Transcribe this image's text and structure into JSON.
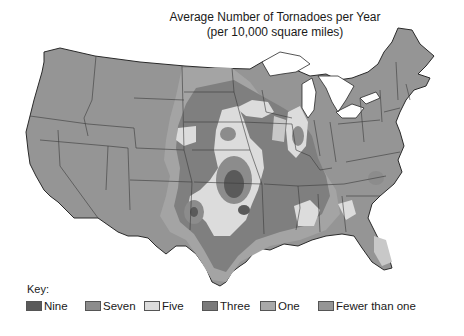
{
  "title": {
    "line1": "Average Number of Tornadoes per Year",
    "line2": "(per 10,000 square miles)"
  },
  "key": {
    "label": "Key:",
    "items": [
      {
        "label": "Nine",
        "color": "#5a5a5a"
      },
      {
        "label": "Seven",
        "color": "#8c8c8c"
      },
      {
        "label": "Five",
        "color": "#dcdcdc"
      },
      {
        "label": "Three",
        "color": "#7a7a7a"
      },
      {
        "label": "One",
        "color": "#a9a9a9"
      },
      {
        "label": "Fewer than one",
        "color": "#959595"
      }
    ]
  },
  "map": {
    "region": "Contiguous United States",
    "colors": {
      "nine": "#5a5a5a",
      "seven": "#8c8c8c",
      "five": "#dcdcdc",
      "three": "#7f7f7f",
      "one": "#a9a9a9",
      "fewer_than_one": "#959595",
      "border": "#3a3a3a",
      "water": "#ffffff"
    }
  }
}
